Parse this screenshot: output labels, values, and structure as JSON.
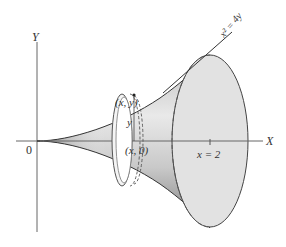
{
  "diagram": {
    "axes": {
      "x_label": "X",
      "y_label": "Y",
      "origin_label": "0"
    },
    "curve_label": "x² = 4y",
    "point_label": "(x, y)",
    "axis_point_label": "(x, 0)",
    "radius_label": "y",
    "bound_label": "x = 2",
    "colors": {
      "axis": "#555555",
      "outline": "#444444",
      "surface_dark": "#8a8a8a",
      "surface_light": "#e6e6e6",
      "disk_fill": "#dedede"
    }
  }
}
